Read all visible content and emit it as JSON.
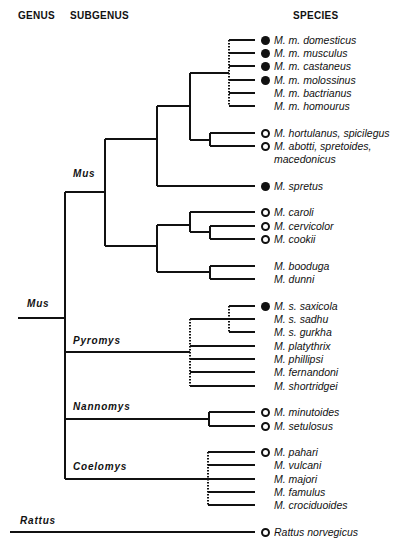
{
  "headers": {
    "genus": "GENUS",
    "subgenus": "SUBGENUS",
    "species": "SPECIES"
  },
  "clades": {
    "mus_genus": "Mus",
    "mus_subgenus": "Mus",
    "pyromys": "Pyromys",
    "nannomys": "Nannomys",
    "coelomys": "Coelomys",
    "rattus": "Rattus"
  },
  "legend_marks": {
    "filled": "filled-circle",
    "open": "open-circle",
    "none": "none"
  },
  "species": [
    {
      "name": "M. m. domesticus",
      "mark": "filled"
    },
    {
      "name": "M. m. musculus",
      "mark": "filled"
    },
    {
      "name": "M. m. castaneus",
      "mark": "filled"
    },
    {
      "name": "M. m. molossinus",
      "mark": "filled"
    },
    {
      "name": "M. m. bactrianus",
      "mark": "none"
    },
    {
      "name": "M. m. homourus",
      "mark": "none"
    },
    {
      "name": "M. hortulanus, spicilegus",
      "mark": "open"
    },
    {
      "name": "M. abotti, spretoides,",
      "name2": "macedonicus",
      "mark": "open"
    },
    {
      "name": "M. spretus",
      "mark": "filled"
    },
    {
      "name": "M. caroli",
      "mark": "open"
    },
    {
      "name": "M. cervicolor",
      "mark": "open"
    },
    {
      "name": "M. cookii",
      "mark": "open"
    },
    {
      "name": "M. booduga",
      "mark": "none"
    },
    {
      "name": "M. dunni",
      "mark": "none"
    },
    {
      "name": "M. s. saxicola",
      "mark": "filled"
    },
    {
      "name": "M. s. sadhu",
      "mark": "none"
    },
    {
      "name": "M. s. gurkha",
      "mark": "none"
    },
    {
      "name": "M. platythrix",
      "mark": "none"
    },
    {
      "name": "M. phillipsi",
      "mark": "none"
    },
    {
      "name": "M. fernandoni",
      "mark": "none"
    },
    {
      "name": "M. shortridgei",
      "mark": "none"
    },
    {
      "name": "M. minutoides",
      "mark": "open"
    },
    {
      "name": "M. setulosus",
      "mark": "open"
    },
    {
      "name": "M. pahari",
      "mark": "open"
    },
    {
      "name": "M. vulcani",
      "mark": "none"
    },
    {
      "name": "M. majori",
      "mark": "none"
    },
    {
      "name": "M. famulus",
      "mark": "none"
    },
    {
      "name": "M. crociduoides",
      "mark": "none"
    },
    {
      "name": "Rattus norvegicus",
      "mark": "open"
    }
  ],
  "tree": {
    "note": "Phylogeny of genus Mus with outgroup Rattus; dotted vertical connectors denote unresolved polytomies",
    "topology": "((((Mm_complex_polytomy,(hortulanus/spicilegus,abotti/spretoides/macedonicus)),spretus),((caroli,(cervicolor,cookii)),(booduga,dunni))),Pyromys_polytomy((saxicola,sadhu,gurkha),platythrix,phillipsi,fernandoni,shortridgei),Nannomys(minutoides,setulosus),Coelomys_polytomy(pahari,vulcani,majori,famulus,crociduoides)),Rattus norvegicus"
  }
}
